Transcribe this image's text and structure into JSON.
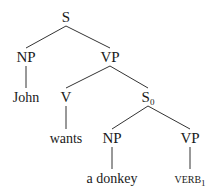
{
  "diagram": {
    "type": "syntax-tree",
    "nodes": [
      {
        "id": "S",
        "label": "S",
        "sub": "",
        "x": 66,
        "y": 22,
        "role": "category"
      },
      {
        "id": "NP1",
        "label": "NP",
        "sub": "",
        "x": 26,
        "y": 62,
        "role": "category"
      },
      {
        "id": "VP1",
        "label": "VP",
        "sub": "",
        "x": 110,
        "y": 62,
        "role": "category"
      },
      {
        "id": "John",
        "label": "John",
        "sub": "",
        "x": 26,
        "y": 102,
        "role": "word"
      },
      {
        "id": "V",
        "label": "V",
        "sub": "",
        "x": 66,
        "y": 102,
        "role": "category"
      },
      {
        "id": "S0",
        "label": "S",
        "sub": "0",
        "x": 148,
        "y": 102,
        "role": "category"
      },
      {
        "id": "wants",
        "label": "wants",
        "sub": "",
        "x": 66,
        "y": 143,
        "role": "word"
      },
      {
        "id": "NP2",
        "label": "NP",
        "sub": "",
        "x": 112,
        "y": 143,
        "role": "category"
      },
      {
        "id": "VP2",
        "label": "VP",
        "sub": "",
        "x": 190,
        "y": 143,
        "role": "category"
      },
      {
        "id": "donkey",
        "label": "a donkey",
        "sub": "",
        "x": 112,
        "y": 183,
        "role": "word"
      },
      {
        "id": "VERB1",
        "label": "VERB",
        "sub": "1",
        "x": 190,
        "y": 183,
        "role": "smallcaps-word"
      }
    ],
    "edges": [
      [
        "S",
        "NP1"
      ],
      [
        "S",
        "VP1"
      ],
      [
        "NP1",
        "John"
      ],
      [
        "VP1",
        "V"
      ],
      [
        "VP1",
        "S0"
      ],
      [
        "V",
        "wants"
      ],
      [
        "S0",
        "NP2"
      ],
      [
        "S0",
        "VP2"
      ],
      [
        "NP2",
        "donkey"
      ],
      [
        "VP2",
        "VERB1"
      ]
    ]
  }
}
